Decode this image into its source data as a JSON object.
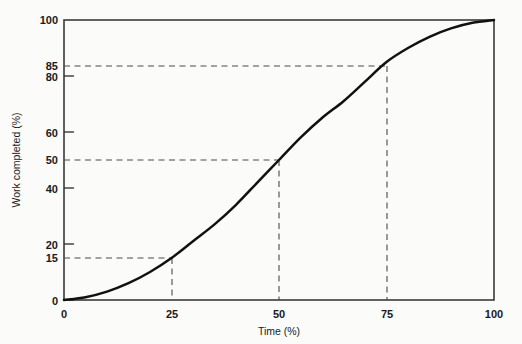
{
  "chart_data": {
    "type": "line",
    "title": "",
    "xlabel": "Time (%)",
    "ylabel": "Work completed (%)",
    "xlim": [
      0,
      100
    ],
    "ylim": [
      0,
      100
    ],
    "grid": false,
    "legend": null,
    "x_ticks": [
      "0",
      "25",
      "50",
      "75",
      "100"
    ],
    "x_tick_values": [
      0,
      25,
      50,
      75,
      100
    ],
    "y_ticks": [
      "0",
      "15",
      "20",
      "40",
      "50",
      "60",
      "80",
      "85",
      "100"
    ],
    "y_tick_values": [
      0,
      15,
      20,
      40,
      50,
      60,
      80,
      85,
      100
    ],
    "series": [
      {
        "name": "S-curve",
        "x": [
          0,
          5,
          10,
          15,
          20,
          25,
          30,
          35,
          40,
          45,
          50,
          55,
          60,
          65,
          70,
          75,
          80,
          85,
          90,
          95,
          100
        ],
        "values": [
          0,
          1,
          3,
          6,
          10,
          15,
          21,
          27,
          34,
          42,
          50,
          58,
          65,
          71,
          78,
          85,
          90,
          94,
          97,
          99,
          100
        ]
      }
    ],
    "annotations": [
      {
        "label": "25% time / 15% work",
        "x": 25,
        "y": 15,
        "style": "dashed-guide"
      },
      {
        "label": "50% time / 50% work",
        "x": 50,
        "y": 50,
        "style": "dashed-guide"
      },
      {
        "label": "75% time / 85% work",
        "x": 75,
        "y": 85,
        "style": "dashed-guide"
      }
    ]
  },
  "colors": {
    "page_background": "#fbfbfa",
    "curve": "#111111",
    "axis": "#3a3a3a",
    "guide": "#4a4a4a",
    "text": "#1a1a1a"
  }
}
